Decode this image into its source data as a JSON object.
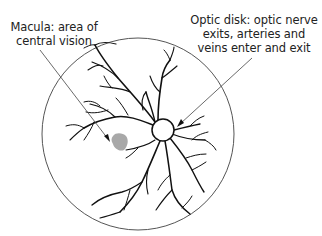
{
  "diagram": {
    "labels": {
      "macula": {
        "line1": "Macula: area of",
        "line2": "central vision"
      },
      "optic_disk": {
        "line1": "Optic disk: optic nerve",
        "line2": "exits, arteries and",
        "line3": "veins enter and exit"
      }
    },
    "colors": {
      "outline": "#555555",
      "vessels": "#111111",
      "macula_fill": "#a8a8a8",
      "leader_line": "#444444",
      "text": "#222222"
    }
  }
}
